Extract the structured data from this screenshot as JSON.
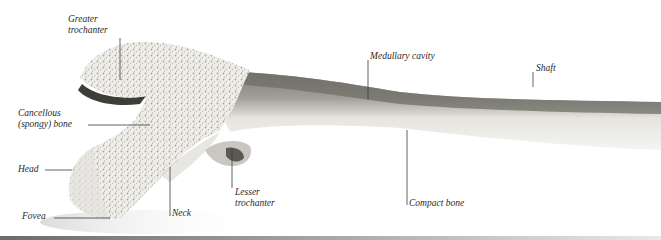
{
  "diagram": {
    "labels": [
      {
        "id": "greater-trochanter",
        "lines": [
          "Greater",
          "trochanter"
        ]
      },
      {
        "id": "cancellous-bone",
        "lines": [
          "Cancellous",
          "(spongy) bone"
        ]
      },
      {
        "id": "head",
        "lines": [
          "Head"
        ]
      },
      {
        "id": "fovea",
        "lines": [
          "Fovea"
        ]
      },
      {
        "id": "neck",
        "lines": [
          "Neck"
        ]
      },
      {
        "id": "lesser-trochanter",
        "lines": [
          "Lesser",
          "trochanter"
        ]
      },
      {
        "id": "medullary-cavity",
        "lines": [
          "Medullary cavity"
        ]
      },
      {
        "id": "shaft",
        "lines": [
          "Shaft"
        ]
      },
      {
        "id": "compact-bone",
        "lines": [
          "Compact bone"
        ]
      }
    ],
    "colors": {
      "background": "#ffffff",
      "bone_light": "#ecebe6",
      "bone_texture": "#9a978e",
      "cortex_dark": "#6f6d67",
      "leader_line": "#3a3a3a",
      "label_text": "#2a2a2a"
    }
  }
}
